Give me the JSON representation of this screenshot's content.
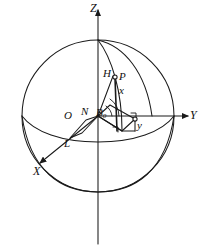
{
  "figure": {
    "kind": "geometry-diagram",
    "background_color": "#ffffff",
    "stroke_color": "#1a1a1a",
    "axes": [
      {
        "id": "z",
        "label": "Z",
        "direction": "up"
      },
      {
        "id": "y",
        "label": "Y",
        "direction": "right"
      },
      {
        "id": "x",
        "label": "X",
        "direction": "down-left"
      }
    ],
    "points": [
      {
        "id": "origin",
        "label": "O",
        "marker": "none"
      },
      {
        "id": "node-n",
        "label": "N",
        "marker": "none"
      },
      {
        "id": "point-h",
        "label": "H",
        "marker": "none"
      },
      {
        "id": "point-p",
        "label": "P",
        "marker": "circle"
      },
      {
        "id": "point-l",
        "label": "L",
        "marker": "none"
      }
    ],
    "segments": [
      {
        "id": "x-ordinate",
        "label": "x"
      },
      {
        "id": "y-ordinate",
        "label": "y"
      }
    ],
    "angles": [
      {
        "id": "angle-b0",
        "label": "B",
        "subscript": "0"
      }
    ]
  }
}
